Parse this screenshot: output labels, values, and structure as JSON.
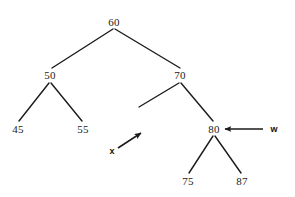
{
  "diagram": {
    "type": "binary-search-tree",
    "background_color": "#ffffff",
    "stroke_color": "#1a1a1a",
    "nodes": [
      {
        "id": "n60",
        "label": "60",
        "x": 114,
        "y": 22,
        "apex_x": 114,
        "apex_y": 29
      },
      {
        "id": "n50",
        "label": "50",
        "x": 50,
        "y": 75,
        "apex_x": 50,
        "apex_y": 83
      },
      {
        "id": "n70",
        "label": "70",
        "x": 180,
        "y": 75,
        "apex_x": 180,
        "apex_y": 83
      },
      {
        "id": "n45",
        "label": "45",
        "x": 18,
        "y": 129,
        "apex_x": 18,
        "apex_y": 122
      },
      {
        "id": "n55",
        "label": "55",
        "x": 83,
        "y": 129,
        "apex_x": 83,
        "apex_y": 122
      },
      {
        "id": "n80",
        "label": "80",
        "x": 214,
        "y": 129,
        "apex_x": 214,
        "apex_y": 136
      },
      {
        "id": "n75",
        "label": "75",
        "x": 188,
        "y": 181,
        "apex_x": 188,
        "apex_y": 174
      },
      {
        "id": "n87",
        "label": "87",
        "x": 242,
        "y": 181,
        "apex_x": 242,
        "apex_y": 174
      }
    ],
    "edges": [
      {
        "id": "e60-50",
        "from": "n60",
        "to": "n50",
        "x1": 113,
        "y1": 29,
        "x2": 52,
        "y2": 68
      },
      {
        "id": "e60-70",
        "from": "n60",
        "to": "n70",
        "x1": 115,
        "y1": 29,
        "x2": 180,
        "y2": 68
      },
      {
        "id": "e50-45",
        "from": "n50",
        "to": "n45",
        "x1": 49,
        "y1": 83,
        "x2": 19,
        "y2": 121
      },
      {
        "id": "e50-55",
        "from": "n50",
        "to": "n55",
        "x1": 51,
        "y1": 83,
        "x2": 82,
        "y2": 121
      },
      {
        "id": "e70-left-empty",
        "from": "n70",
        "to": "empty-left-child",
        "x1": 179,
        "y1": 83,
        "x2": 139,
        "y2": 107
      },
      {
        "id": "e70-80",
        "from": "n70",
        "to": "n80",
        "x1": 181,
        "y1": 83,
        "x2": 213,
        "y2": 121
      },
      {
        "id": "e80-75",
        "from": "n80",
        "to": "n75",
        "x1": 213,
        "y1": 136,
        "x2": 189,
        "y2": 173
      },
      {
        "id": "e80-87",
        "from": "n80",
        "to": "n87",
        "x1": 215,
        "y1": 136,
        "x2": 241,
        "y2": 173
      }
    ],
    "pointers": [
      {
        "id": "ptr-w",
        "label": "w",
        "label_x": 274,
        "label_y": 129,
        "target_node": "n80",
        "direction": "left",
        "tail_x": 263,
        "tail_y": 129,
        "head_x": 225,
        "head_y": 129
      },
      {
        "id": "ptr-x",
        "label": "x",
        "label_x": 112,
        "label_y": 151,
        "target_node": "empty-left-child",
        "direction": "up-right",
        "tail_x": 118,
        "tail_y": 148,
        "head_x": 141,
        "head_y": 133
      }
    ]
  }
}
